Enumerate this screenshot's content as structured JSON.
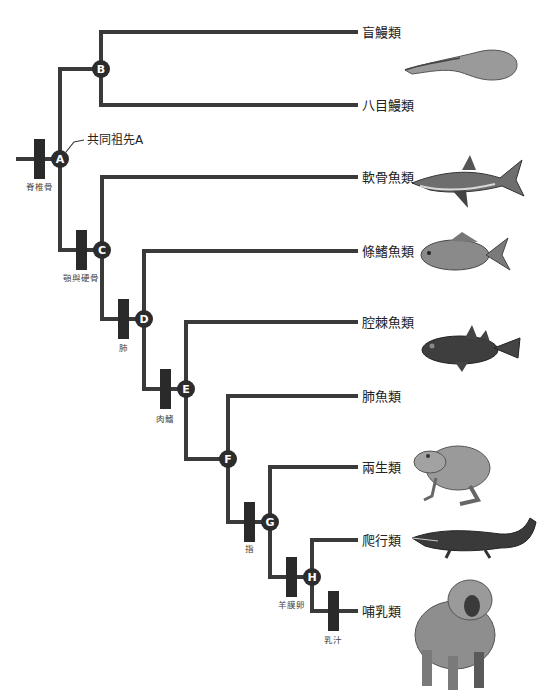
{
  "diagram": {
    "type": "cladogram",
    "colors": {
      "branch": "#3a3a3a",
      "trait_bar": "#2a2a2a",
      "node_fill": "#2c2c2c",
      "node_text": "#ffffff",
      "text": "#222222"
    },
    "ancestor_annotation": "共同祖先A",
    "nodes": [
      {
        "id": "A",
        "label": "A"
      },
      {
        "id": "B",
        "label": "B"
      },
      {
        "id": "C",
        "label": "C"
      },
      {
        "id": "D",
        "label": "D"
      },
      {
        "id": "E",
        "label": "E"
      },
      {
        "id": "F",
        "label": "F"
      },
      {
        "id": "G",
        "label": "G"
      },
      {
        "id": "H",
        "label": "H"
      }
    ],
    "taxa": [
      {
        "id": "hagfish",
        "label": "盲鰻類",
        "illustration": "eel"
      },
      {
        "id": "lamprey",
        "label": "八目鰻類",
        "illustration": null
      },
      {
        "id": "cartilaginous",
        "label": "軟骨魚類",
        "illustration": "shark"
      },
      {
        "id": "ray-finned",
        "label": "條鰭魚類",
        "illustration": "carp"
      },
      {
        "id": "coelacanth",
        "label": "腔棘魚類",
        "illustration": "coelacanth"
      },
      {
        "id": "lungfish",
        "label": "肺魚類",
        "illustration": null
      },
      {
        "id": "amphibian",
        "label": "兩生類",
        "illustration": "frog"
      },
      {
        "id": "reptile",
        "label": "爬行類",
        "illustration": "crocodile"
      },
      {
        "id": "mammal",
        "label": "哺乳類",
        "illustration": "baboon"
      }
    ],
    "traits": [
      {
        "id": "vertebrae",
        "label": "脊椎骨"
      },
      {
        "id": "jaws",
        "label": "顎與硬骨"
      },
      {
        "id": "lungs",
        "label": "肺"
      },
      {
        "id": "lobe-fins",
        "label": "肉鰭"
      },
      {
        "id": "digits",
        "label": "指"
      },
      {
        "id": "amniotic-egg",
        "label": "羊膜卵"
      },
      {
        "id": "milk",
        "label": "乳汁"
      }
    ]
  }
}
